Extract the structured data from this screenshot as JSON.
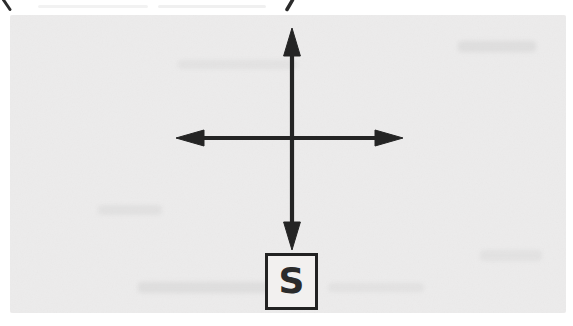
{
  "figure": {
    "source_label": "S"
  },
  "colors": {
    "paper": "#ffffff",
    "panel_gray": "#ecebeb",
    "ink": "#222222"
  }
}
